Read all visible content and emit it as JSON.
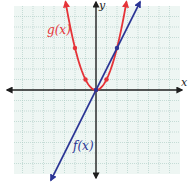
{
  "chart_data": {
    "type": "line",
    "title": "",
    "xlabel": "x",
    "ylabel": "y",
    "xlim": [
      -8,
      8
    ],
    "ylim": [
      -8,
      8
    ],
    "grid": true,
    "series": [
      {
        "name": "f(x)",
        "equation": "f(x) = 2x",
        "color": "#2b3595",
        "points": [
          [
            0,
            0
          ],
          [
            2,
            4
          ]
        ],
        "x_range": [
          -4.3,
          4.2
        ]
      },
      {
        "name": "g(x)",
        "equation": "g(x) = x^2",
        "color": "#e53338",
        "points": [
          [
            -2,
            4
          ],
          [
            -1,
            1
          ],
          [
            0,
            0
          ],
          [
            1,
            1
          ]
        ],
        "x_range": [
          -2.9,
          2.9
        ]
      }
    ]
  },
  "labels": {
    "x_axis": "x",
    "y_axis": "y",
    "f": "f(x)",
    "g": "g(x)"
  },
  "colors": {
    "background": "#ffffff",
    "grid_fill": "#eef6f3",
    "grid_line": "#a9cbc2",
    "axis": "#1e1e1e",
    "f_line": "#2b3595",
    "g_curve": "#e53338"
  }
}
